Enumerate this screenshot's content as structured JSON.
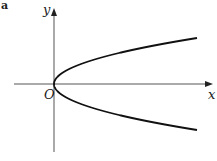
{
  "figure": {
    "panel_label": "a",
    "axis_labels": {
      "x": "x",
      "y": "y",
      "origin": "O"
    },
    "curve": {
      "type": "parabola",
      "equation_form": "y^2 = kx (opens right)",
      "vertex": "O"
    },
    "colors": {
      "axis": "#555555",
      "curve": "#111111",
      "background": "#ffffff"
    }
  }
}
